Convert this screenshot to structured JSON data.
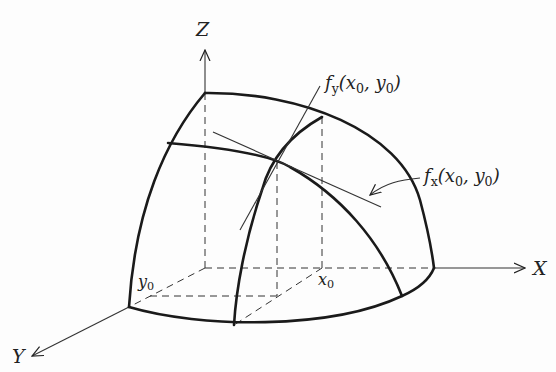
{
  "diagram": {
    "axes": {
      "x": {
        "label": "X"
      },
      "y": {
        "label": "Y"
      },
      "z": {
        "label": "Z"
      }
    },
    "labels": {
      "fy": {
        "name": "f",
        "sub": "y",
        "args": "(x",
        "arg1_sub": "0",
        "sep": ", y",
        "arg2_sub": "0",
        "close": ")"
      },
      "fx": {
        "name": "f",
        "sub": "x",
        "args": "(x",
        "arg1_sub": "0",
        "sep": ", y",
        "arg2_sub": "0",
        "close": ")"
      },
      "x0": {
        "name": "x",
        "sub": "0"
      },
      "y0": {
        "name": "y",
        "sub": "0"
      }
    },
    "colors": {
      "stroke": "#222222",
      "background": "#fdfdfd"
    }
  }
}
